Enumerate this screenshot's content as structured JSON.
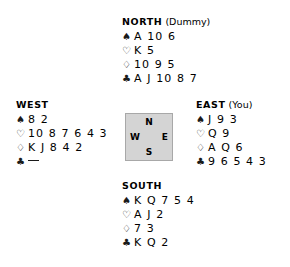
{
  "diagram": {
    "compass": {
      "north": "N",
      "south": "S",
      "west": "W",
      "east": "E"
    },
    "suit_symbols": {
      "spade": "♠",
      "heart": "♡",
      "diamond": "♢",
      "club": "♣"
    },
    "hands": {
      "north": {
        "label": "NORTH",
        "note": " (Dummy)",
        "spades": "A 10 6",
        "hearts": "K 5",
        "diamonds": "10 9 5",
        "clubs": "A J 10 8 7"
      },
      "west": {
        "label": "WEST",
        "note": "",
        "spades": "8 2",
        "hearts": "10 8 7 6 4 3",
        "diamonds": "K J 8 4 2",
        "clubs": ""
      },
      "east": {
        "label": "EAST",
        "note": " (You)",
        "spades": "J 9 3",
        "hearts": "Q 9",
        "diamonds": "A Q 6",
        "clubs": "9 6 5 4 3"
      },
      "south": {
        "label": "SOUTH",
        "note": "",
        "spades": "K Q 7 5 4",
        "hearts": "A J 2",
        "diamonds": "7 3",
        "clubs": "K Q 2"
      }
    }
  }
}
